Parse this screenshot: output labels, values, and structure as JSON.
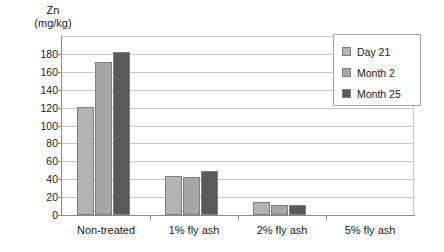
{
  "chart_data": {
    "type": "bar",
    "title": "",
    "ylabel": "Zn (mg/kg)",
    "ylabel_line1": "Zn",
    "ylabel_line2": "(mg/kg)",
    "xlabel": "",
    "categories": [
      "Non-treated",
      "1% fly ash",
      "2% fly ash",
      "5% fly ash"
    ],
    "series": [
      {
        "name": "Day 21",
        "color": "#b3b3b3",
        "values": [
          121,
          44,
          14,
          0
        ]
      },
      {
        "name": "Month 2",
        "color": "#a6a6a6",
        "values": [
          171,
          42,
          11,
          0
        ]
      },
      {
        "name": "Month 25",
        "color": "#595959",
        "values": [
          182,
          49,
          11,
          0
        ]
      }
    ],
    "ylim": [
      0,
      200
    ],
    "yticks": [
      0,
      20,
      40,
      60,
      80,
      100,
      120,
      140,
      160,
      180
    ],
    "ytick_labels": [
      "0",
      "20",
      "40",
      "60",
      "80",
      "100",
      "120",
      "140",
      "160",
      "180"
    ],
    "grid": true,
    "grid_axis": "y",
    "legend_position": "top-right"
  },
  "legend": {
    "entries": [
      {
        "label": "Day 21",
        "color": "#b3b3b3"
      },
      {
        "label": "Month 2",
        "color": "#a6a6a6"
      },
      {
        "label": "Month 25",
        "color": "#595959"
      }
    ]
  }
}
